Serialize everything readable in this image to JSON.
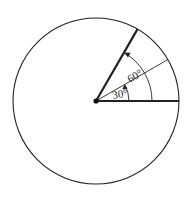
{
  "diagram": {
    "type": "circle-angles",
    "center": {
      "x": 96,
      "y": 101
    },
    "radius": 83,
    "colors": {
      "stroke": "#222222",
      "background": "#ffffff"
    },
    "rays": [
      {
        "angle_deg": 0,
        "weight": "bold"
      },
      {
        "angle_deg": 30,
        "weight": "thin"
      },
      {
        "angle_deg": 60,
        "weight": "bold"
      }
    ],
    "arcs": [
      {
        "label": "30°",
        "from_deg": 0,
        "to_deg": 30,
        "radius": 33
      },
      {
        "label": "60°",
        "from_deg": 0,
        "to_deg": 60,
        "radius": 56
      }
    ],
    "labels": {
      "angle_30": "30°",
      "angle_60": "60°"
    }
  }
}
